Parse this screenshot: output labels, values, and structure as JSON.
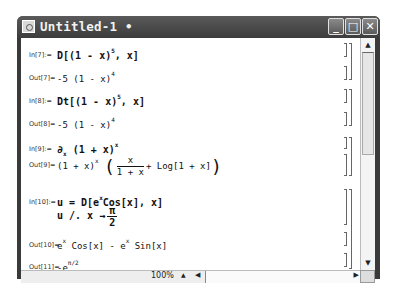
{
  "window": {
    "title": "Untitled-1 •",
    "buttons": [
      "minimize",
      "maximize",
      "close"
    ],
    "minimize_glyph": "_",
    "maximize_glyph": "□",
    "close_glyph": "✕"
  },
  "cells": [
    {
      "label": "In[7]:=",
      "type": "input",
      "text": "D[(1 - x)^5, x]"
    },
    {
      "label": "Out[7]=",
      "type": "output",
      "text": "-5 (1 - x)^4"
    },
    {
      "label": "In[8]:=",
      "type": "input",
      "text": "Dt[(1 - x)^5, x]"
    },
    {
      "label": "Out[8]=",
      "type": "output",
      "text": "-5 (1 - x)^4"
    },
    {
      "label": "In[9]:=",
      "type": "input",
      "text": "∂x (1 + x)^x"
    },
    {
      "label": "Out[9]=",
      "type": "output",
      "text": "(1 + x)^x (x/(1 + x) + Log[1 + x])"
    },
    {
      "label": "In[10]:=",
      "type": "input",
      "text": "u = D[e^x Cos[x], x]\nu /. x → π/2"
    },
    {
      "label": "Out[10]=",
      "type": "output",
      "text": "e^x Cos[x] - e^x Sin[x]"
    },
    {
      "label": "Out[11]=",
      "type": "output",
      "text": "-e^(π/2)"
    }
  ],
  "math": {
    "in7_pre": "D[(1 - x)",
    "in7_exp": "5",
    "in7_post": ", x]",
    "out7_pre": "-5 (1 - x)",
    "out7_exp": "4",
    "in8_pre": "Dt[(1 - x)",
    "in8_exp": "5",
    "in8_post": ", x]",
    "out8_pre": "-5 (1 - x)",
    "out8_exp": "4",
    "in9_pre": "∂",
    "in9_sub": "x",
    "in9_mid": " (1 + x)",
    "in9_exp": "x",
    "out9_pre": "(1 + x)",
    "out9_exp": "x",
    "out9_num": "x",
    "out9_den": "1 + x",
    "out9_post": "+ Log[1 + x]",
    "in10_line1_pre": "u = D[e",
    "in10_line1_exp": "x",
    "in10_line1_post": "Cos[x], x]",
    "in10_line2_pre": "u /. x →",
    "in10_line2_num": "π",
    "in10_line2_den": "2",
    "out10_a": "e",
    "out10_a_exp": "x",
    "out10_b": " Cos[x] - e",
    "out10_b_exp": "x",
    "out10_c": " Sin[x]",
    "out11_pre": "-e",
    "out11_exp": "π/2"
  },
  "status": {
    "zoom": "100%",
    "zoom_up_glyph": "▲",
    "scroll_left_glyph": "◀",
    "scroll_right_glyph": "▶",
    "scroll_up_glyph": "▲",
    "scroll_down_glyph": "▼"
  }
}
